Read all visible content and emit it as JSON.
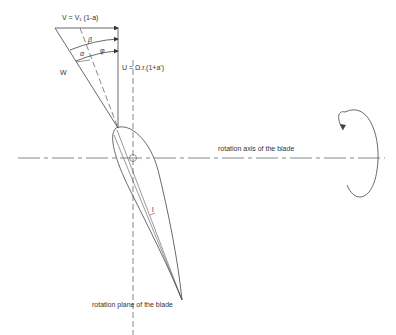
{
  "diagram": {
    "type": "wind turbine blade element velocity triangle",
    "labels": {
      "axial_velocity": "V = V₁ (1-a)",
      "tangential_velocity": "U = Ω.r.(1+a')",
      "relative_velocity": "W",
      "rotation_axis": "rotation axis of the blade",
      "rotation_plane": "rotation plane of the blade",
      "angle_beta": "β",
      "angle_phi": "φ",
      "angle_alpha": "α",
      "chord": "l"
    },
    "icons": {
      "rotation_arrow": "circular-rotation-arrow"
    },
    "colors": {
      "line": "#444444",
      "background": "#ffffff"
    }
  }
}
